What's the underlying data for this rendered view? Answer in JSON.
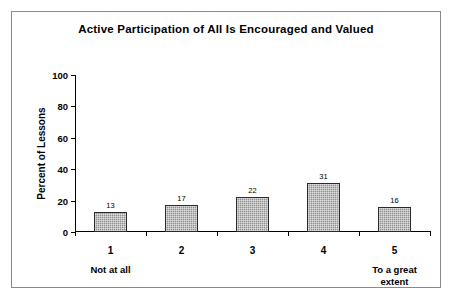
{
  "chart_data": {
    "type": "bar",
    "title": "Active Participation of All Is Encouraged and Valued",
    "xlabel": "",
    "ylabel": "Percent of Lessons",
    "categories": [
      "1",
      "2",
      "3",
      "4",
      "5"
    ],
    "values": [
      13,
      17,
      22,
      31,
      16
    ],
    "value_labels": [
      "13",
      "17",
      "22",
      "31",
      "16"
    ],
    "ylim": [
      0,
      100
    ],
    "ytick_labels": [
      "0",
      "20",
      "40",
      "60",
      "80",
      "100"
    ],
    "yticks": [
      0,
      20,
      40,
      60,
      80,
      100
    ],
    "grid": false,
    "legend": false,
    "category_sublabels": {
      "1": "Not at all",
      "5": "To a great\nextent"
    },
    "colors": {
      "bar_fill": "#8e8e8e",
      "bar_border": "#2b2b2b",
      "axis": "#000000",
      "frame": "#8a8a8a",
      "background": "#ffffff",
      "text": "#000000"
    }
  }
}
